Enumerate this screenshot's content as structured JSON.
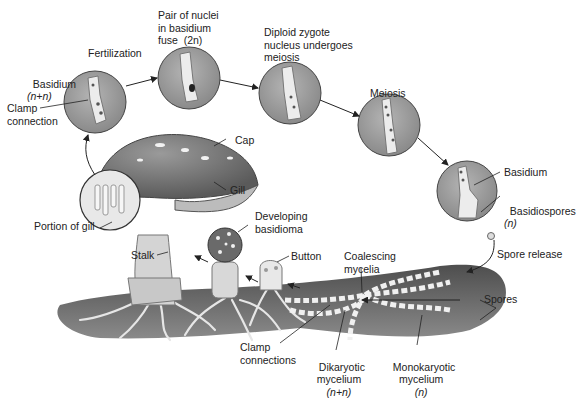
{
  "colors": {
    "circle_fill": "#9a9a9a",
    "circle_stroke": "#444444",
    "cell_fill": "#ececec",
    "soil": "#5e5e5e",
    "cap": "#7a7a7a",
    "stalk": "#d2d2d2",
    "arrow": "#222222",
    "text": "#222222"
  },
  "stages": [
    {
      "id": "basidium-nn",
      "label": "Basidium",
      "sub": "(n+n)"
    },
    {
      "id": "fertilization",
      "label": "Fertilization"
    },
    {
      "id": "nuclei-fuse",
      "label": "Pair of nuclei\nin basidium\nfuse  (2n)"
    },
    {
      "id": "diploid",
      "label": "Diploid zygote\nnucleus undergoes\nmeiosis"
    },
    {
      "id": "meiosis",
      "label": "Meiosis"
    },
    {
      "id": "basidium",
      "label": "Basidium"
    },
    {
      "id": "basidiospores",
      "label": "Basidiospores",
      "sub": "(n)"
    }
  ],
  "labels": {
    "clamp_connection": "Clamp\nconnection",
    "cap": "Cap",
    "gill": "Gill",
    "portion_of_gill": "Portion of gill",
    "developing_basidioma": "Developing\nbasidioma",
    "stalk": "Stalk",
    "button": "Button",
    "coalescing_mycelia": "Coalescing\nmycelia",
    "spore_release": "Spore release",
    "spores": "Spores",
    "clamp_connections": "Clamp\nconnections",
    "dikaryotic_mycelium": "Dikaryotic\nmycelium",
    "dikaryotic_ploidy": "(n+n)",
    "monokaryotic_mycelium": "Monokaryotic\nmycelium",
    "monokaryotic_ploidy": "(n)"
  }
}
